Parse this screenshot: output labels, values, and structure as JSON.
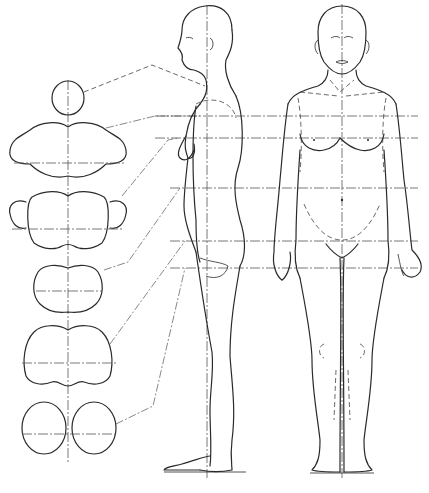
{
  "figure": {
    "title": "",
    "colors": {
      "line": "#2a2a2a",
      "background": "#ffffff"
    }
  },
  "sections": [
    {
      "name": "neck",
      "cx": 68,
      "cy": 96
    },
    {
      "name": "chest",
      "cx": 68,
      "cy": 150
    },
    {
      "name": "waist-with-arms",
      "cx": 68,
      "cy": 215
    },
    {
      "name": "hips",
      "cx": 68,
      "cy": 291
    },
    {
      "name": "thighs-upper",
      "cx": 68,
      "cy": 360
    },
    {
      "name": "thighs",
      "cx": 68,
      "cy": 433
    }
  ],
  "guide_lines_y": [
    116,
    138,
    188,
    241,
    268
  ]
}
